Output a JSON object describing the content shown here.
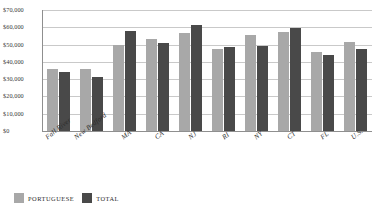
{
  "chart_data": {
    "type": "bar",
    "title": "",
    "xlabel": "",
    "ylabel": "",
    "ylim": [
      0,
      70000
    ],
    "grid": true,
    "legend_position": "bottom-left",
    "categories": [
      "Fall River",
      "New Bedford",
      "MA",
      "CA",
      "NJ",
      "RI",
      "NY",
      "CT",
      "FL",
      "U.S."
    ],
    "ytick_labels": [
      "$70,000",
      "$60,000",
      "$50,000",
      "$40,000",
      "$30,000",
      "$20,000",
      "$10,000",
      "$0"
    ],
    "ytick_values": [
      70000,
      60000,
      50000,
      40000,
      30000,
      20000,
      10000,
      0
    ],
    "series": [
      {
        "name": "PORTUGUESE",
        "color": "#a8a8a8",
        "values": [
          36000,
          36000,
          49500,
          53500,
          56500,
          47500,
          55500,
          57500,
          45500,
          51500
        ]
      },
      {
        "name": "TOTAL",
        "color": "#494949",
        "values": [
          34000,
          31500,
          58000,
          51000,
          61500,
          48500,
          49000,
          59500,
          44000,
          47500
        ]
      }
    ]
  },
  "legend": {
    "items": [
      {
        "label": "PORTUGUESE",
        "color": "#a8a8a8"
      },
      {
        "label": "TOTAL",
        "color": "#494949"
      }
    ]
  }
}
